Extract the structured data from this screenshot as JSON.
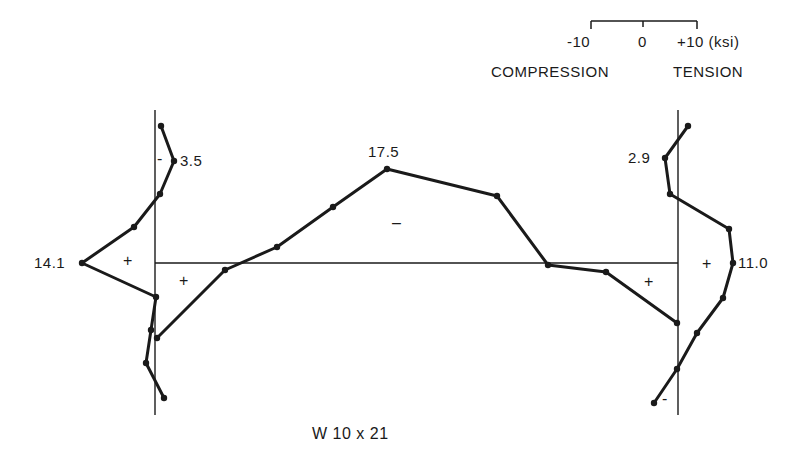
{
  "chart_data": {
    "type": "line",
    "title": "W 10 x 21",
    "scale": {
      "ticks": [
        "-10",
        "0",
        "+10"
      ],
      "unit": "(ksi)",
      "left_label": "COMPRESSION",
      "right_label": "TENSION"
    },
    "peak_labels": {
      "left_flange_top": "3.5",
      "left_flange_peak": "14.1",
      "web_peak": "17.5",
      "right_flange_top": "2.9",
      "right_flange_peak": "11.0"
    },
    "series": [
      {
        "name": "Left flange",
        "axis": "vertical",
        "points_px": [
          [
            161,
            126
          ],
          [
            174,
            161
          ],
          [
            160,
            194
          ],
          [
            134,
            227
          ],
          [
            82,
            263
          ],
          [
            156,
            297
          ],
          [
            151,
            330
          ],
          [
            146,
            363
          ],
          [
            164,
            398
          ]
        ],
        "signs": [
          {
            "text": "-",
            "x": 160,
            "y": 161
          },
          {
            "text": "+",
            "x": 128,
            "y": 263
          }
        ]
      },
      {
        "name": "Web",
        "axis": "horizontal",
        "points_px": [
          [
            157,
            338
          ],
          [
            225,
            270
          ],
          [
            277,
            247
          ],
          [
            333,
            207
          ],
          [
            387,
            169
          ],
          [
            497,
            196
          ],
          [
            548,
            265
          ],
          [
            606,
            272
          ],
          [
            677,
            323
          ]
        ],
        "signs": [
          {
            "text": "+",
            "x": 184,
            "y": 283
          },
          {
            "text": "–",
            "x": 400,
            "y": 226
          },
          {
            "text": "+",
            "x": 649,
            "y": 284
          }
        ]
      },
      {
        "name": "Right flange",
        "axis": "vertical",
        "points_px": [
          [
            688,
            126
          ],
          [
            665,
            158
          ],
          [
            670,
            194
          ],
          [
            729,
            229
          ],
          [
            733,
            263
          ],
          [
            723,
            298
          ],
          [
            697,
            333
          ],
          [
            677,
            369
          ],
          [
            654,
            403
          ]
        ],
        "signs": [
          {
            "text": "+",
            "x": 707,
            "y": 266
          },
          {
            "text": "-",
            "x": 666,
            "y": 401
          }
        ]
      }
    ],
    "values_ksi": {
      "left_flange_max_compression": 3.5,
      "left_flange_max_tension": 14.1,
      "web_max_compression": 17.5,
      "right_flange_max_compression": 2.9,
      "right_flange_max_tension": 11.0
    }
  },
  "labels": {
    "scale_neg": "-10",
    "scale_zero": "0",
    "scale_pos": "+10 (ksi)",
    "compression": "COMPRESSION",
    "tension": "TENSION",
    "v35": "3.5",
    "v141": "14.1",
    "v175": "17.5",
    "v29": "2.9",
    "v110": "11.0",
    "section": "W 10 x 21"
  },
  "signs": {
    "lf_minus": "-",
    "lf_plus": "+",
    "web_plus_left": "+",
    "web_minus": "–",
    "web_plus_right": "+",
    "rf_plus": "+",
    "rf_minus": "-"
  }
}
